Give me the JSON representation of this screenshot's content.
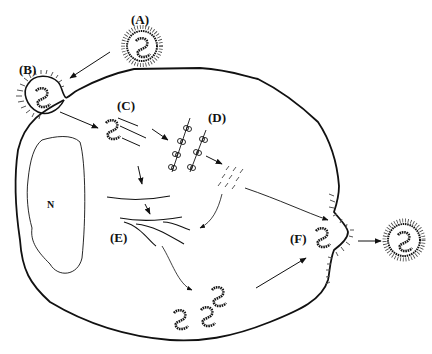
{
  "diagram": {
    "type": "virus-replication-cycle",
    "labels": {
      "A": "(A)",
      "B": "(B)",
      "C": "(C)",
      "D": "(D)",
      "E": "(E)",
      "F": "(F)",
      "nucleus": "N"
    },
    "stages": [
      {
        "id": "A",
        "description": "enveloped virion approaching cell"
      },
      {
        "id": "B",
        "description": "attachment and entry via membrane invagination"
      },
      {
        "id": "C",
        "description": "uncoated nucleocapsid with mRNA strands"
      },
      {
        "id": "D",
        "description": "polysomes translating proteins"
      },
      {
        "id": "E",
        "description": "genome replication strands"
      },
      {
        "id": "F",
        "description": "assembly and budding through membrane"
      }
    ],
    "colors": {
      "line": "#111111",
      "background": "#ffffff"
    }
  }
}
